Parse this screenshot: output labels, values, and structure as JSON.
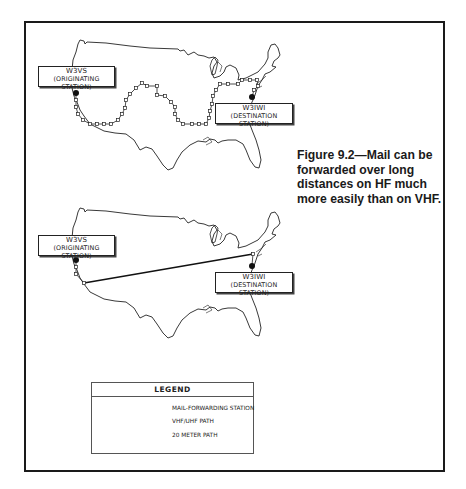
{
  "figure": {
    "caption": "Figure 9.2—Mail can be forwarded over long distances on HF much more easily than on VHF.",
    "caption_lines": [
      "Figure 9.2—Mail can be",
      "forwarded over long",
      "distances on HF much",
      "more easily than on VHF."
    ]
  },
  "maps": [
    {
      "id": "vhf-map",
      "origin": {
        "call": "W3VS",
        "role": "(ORIGINATING STATION)"
      },
      "destination": {
        "call": "W3IWI",
        "role": "(DESTINATION STATION)"
      },
      "path_type": "VHF/UHF PATH",
      "hop_count": 32
    },
    {
      "id": "hf-map",
      "origin": {
        "call": "W3VS",
        "role": "(ORIGINATING STATION)"
      },
      "destination": {
        "call": "W3IWI",
        "role": "(DESTINATION STATION)"
      },
      "path_type": "20 METER PATH"
    }
  ],
  "legend": {
    "title": "LEGEND",
    "items": [
      {
        "symbol": "square-node",
        "label": "MAIL-FORWARDING STATION"
      },
      {
        "symbol": "thin-line",
        "label": "VHF/UHF PATH"
      },
      {
        "symbol": "thick-line",
        "label": "20 METER PATH"
      }
    ]
  },
  "colors": {
    "ink": "#1a1a1a",
    "paper": "#ffffff"
  }
}
